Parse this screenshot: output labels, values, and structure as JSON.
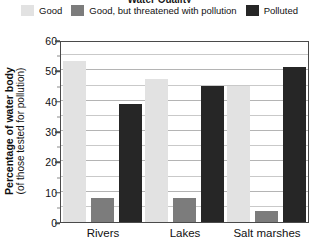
{
  "title": {
    "text": "Water Quality"
  },
  "legend": {
    "position": "top",
    "items": [
      {
        "label": "Good",
        "color": "#e2e2e2",
        "key": "good"
      },
      {
        "label": "Good, but threatened with pollution",
        "color": "#7c7c7c",
        "key": "threatened"
      },
      {
        "label": "Polluted",
        "color": "#262626",
        "key": "polluted"
      }
    ]
  },
  "axes": {
    "y_title_line1": "Percentage of water body",
    "y_title_line2": "(of those tested for pollution)",
    "y_ticks": [
      "0",
      "10",
      "20",
      "30",
      "40",
      "50",
      "60"
    ],
    "y_minor_ticks": [
      "5",
      "15",
      "25",
      "35",
      "45",
      "55"
    ],
    "x_labels": [
      "Rivers",
      "Lakes",
      "Salt marshes"
    ]
  },
  "chart_data": {
    "type": "bar",
    "title": "Water Quality",
    "xlabel": "",
    "ylabel": "Percentage of water body (of those tested for pollution)",
    "ylim": [
      0,
      60
    ],
    "y_tick_step": 10,
    "y_minor_step": 5,
    "grid": true,
    "legend_position": "top",
    "categories": [
      "Rivers",
      "Lakes",
      "Salt marshes"
    ],
    "series": [
      {
        "name": "Good",
        "color": "#e2e2e2",
        "values": [
          53,
          47,
          45
        ]
      },
      {
        "name": "Good, but threatened with pollution",
        "color": "#7c7c7c",
        "values": [
          8,
          8,
          3.5
        ]
      },
      {
        "name": "Polluted",
        "color": "#262626",
        "values": [
          39,
          45,
          51
        ]
      }
    ]
  }
}
